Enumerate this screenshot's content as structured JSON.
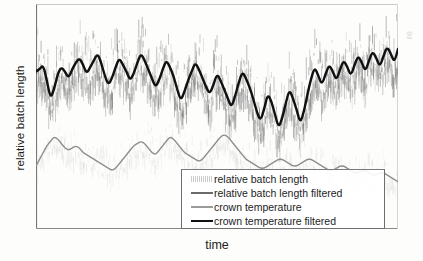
{
  "chart_data": {
    "type": "line",
    "title": "",
    "xlabel": "time",
    "ylabel": "relative batch length",
    "grid": false,
    "legend_position": "bottom-right",
    "axis_frame": "box",
    "xlim": [
      0,
      100
    ],
    "ylim": [
      0,
      100
    ],
    "x_tick_labels": [],
    "y_tick_labels": [],
    "series": [
      {
        "name": "relative batch length",
        "style": "noise",
        "color": "#6e6e6e",
        "x": [
          0,
          1,
          2,
          3,
          4,
          5,
          6,
          7,
          8,
          9,
          10,
          11,
          12,
          13,
          14,
          15,
          16,
          17,
          18,
          19,
          20,
          21,
          22,
          23,
          24,
          25,
          26,
          27,
          28,
          29,
          30,
          31,
          32,
          33,
          34,
          35,
          36,
          37,
          38,
          39,
          40,
          41,
          42,
          43,
          44,
          45,
          46,
          47,
          48,
          49,
          50,
          51,
          52,
          53,
          54,
          55,
          56,
          57,
          58,
          59,
          60,
          61,
          62,
          63,
          64,
          65,
          66,
          67,
          68,
          69,
          70,
          71,
          72,
          73,
          74,
          75,
          76,
          77,
          78,
          79,
          80,
          81,
          82,
          83,
          84,
          85,
          86,
          87,
          88,
          89,
          90,
          91,
          92,
          93,
          94,
          95,
          96,
          97,
          98,
          99,
          100
        ],
        "values": [
          72,
          66,
          78,
          58,
          80,
          62,
          75,
          55,
          83,
          60,
          70,
          52,
          79,
          64,
          86,
          58,
          74,
          61,
          81,
          54,
          77,
          66,
          85,
          57,
          73,
          63,
          82,
          56,
          76,
          68,
          88,
          59,
          71,
          53,
          80,
          65,
          84,
          60,
          75,
          50,
          78,
          62,
          87,
          55,
          72,
          64,
          83,
          58,
          76,
          51,
          69,
          60,
          81,
          54,
          74,
          47,
          68,
          57,
          79,
          49,
          71,
          43,
          65,
          52,
          77,
          45,
          62,
          40,
          70,
          48,
          66,
          38,
          58,
          44,
          72,
          50,
          78,
          55,
          83,
          60,
          79,
          57,
          85,
          63,
          80,
          58,
          86,
          64,
          82,
          59,
          87,
          66,
          83,
          61,
          88,
          67,
          84,
          62,
          89,
          70,
          86
        ],
        "noise_amplitude": 14
      },
      {
        "name": "relative batch length filtered",
        "style": "thick-line",
        "color": "#111111",
        "x": [
          0,
          1,
          2,
          3,
          4,
          5,
          6,
          7,
          8,
          9,
          10,
          11,
          12,
          13,
          14,
          15,
          16,
          17,
          18,
          19,
          20,
          21,
          22,
          23,
          24,
          25,
          26,
          27,
          28,
          29,
          30,
          31,
          32,
          33,
          34,
          35,
          36,
          37,
          38,
          39,
          40,
          41,
          42,
          43,
          44,
          45,
          46,
          47,
          48,
          49,
          50,
          51,
          52,
          53,
          54,
          55,
          56,
          57,
          58,
          59,
          60,
          61,
          62,
          63,
          64,
          65,
          66,
          67,
          68,
          69,
          70,
          71,
          72,
          73,
          74,
          75,
          76,
          77,
          78,
          79,
          80,
          81,
          82,
          83,
          84,
          85,
          86,
          87,
          88,
          89,
          90,
          91,
          92,
          93,
          94,
          95,
          96,
          97,
          98,
          99,
          100
        ],
        "values": [
          70,
          71,
          73,
          66,
          58,
          62,
          69,
          72,
          70,
          67,
          71,
          74,
          76,
          73,
          69,
          72,
          75,
          78,
          74,
          68,
          64,
          67,
          72,
          76,
          73,
          70,
          66,
          69,
          74,
          78,
          75,
          71,
          67,
          63,
          66,
          71,
          75,
          72,
          68,
          62,
          57,
          61,
          66,
          70,
          74,
          71,
          67,
          63,
          60,
          64,
          69,
          66,
          62,
          58,
          54,
          59,
          65,
          70,
          67,
          63,
          58,
          52,
          48,
          53,
          60,
          57,
          51,
          45,
          49,
          56,
          62,
          58,
          53,
          47,
          52,
          60,
          67,
          72,
          68,
          64,
          69,
          73,
          70,
          66,
          71,
          75,
          72,
          68,
          73,
          77,
          74,
          70,
          75,
          79,
          76,
          72,
          77,
          81,
          78,
          74,
          80
        ]
      },
      {
        "name": "crown temperature",
        "style": "noise-light",
        "color": "#b0b0b0",
        "x": [
          0,
          10,
          20,
          30,
          40,
          50,
          60,
          70,
          80,
          90,
          100
        ],
        "values": [
          32,
          36,
          33,
          30,
          34,
          31,
          28,
          30,
          27,
          26,
          25
        ],
        "noise_amplitude": 9
      },
      {
        "name": "crown temperature filtered",
        "style": "thin-line",
        "color": "#8e8e8e",
        "x": [
          0,
          1,
          2,
          3,
          4,
          5,
          6,
          7,
          8,
          9,
          10,
          11,
          12,
          13,
          14,
          15,
          16,
          17,
          18,
          19,
          20,
          21,
          22,
          23,
          24,
          25,
          26,
          27,
          28,
          29,
          30,
          31,
          32,
          33,
          34,
          35,
          36,
          37,
          38,
          39,
          40,
          41,
          42,
          43,
          44,
          45,
          46,
          47,
          48,
          49,
          50,
          51,
          52,
          53,
          54,
          55,
          56,
          57,
          58,
          59,
          60,
          61,
          62,
          63,
          64,
          65,
          66,
          67,
          68,
          69,
          70,
          71,
          72,
          73,
          74,
          75,
          76,
          77,
          78,
          79,
          80,
          81,
          82,
          83,
          84,
          85,
          86,
          87,
          88,
          89,
          90,
          91,
          92,
          93,
          94,
          95,
          96,
          97,
          98,
          99,
          100
        ],
        "values": [
          28,
          31,
          34,
          37,
          39,
          41,
          40,
          38,
          36,
          35,
          36,
          37,
          36,
          34,
          33,
          32,
          31,
          30,
          29,
          28,
          27,
          26,
          27,
          29,
          31,
          33,
          35,
          37,
          38,
          39,
          38,
          36,
          34,
          33,
          35,
          37,
          39,
          41,
          40,
          38,
          36,
          34,
          33,
          32,
          31,
          30,
          31,
          33,
          35,
          37,
          39,
          41,
          42,
          41,
          39,
          37,
          35,
          33,
          31,
          30,
          29,
          28,
          27,
          27,
          28,
          29,
          30,
          31,
          31,
          30,
          29,
          28,
          28,
          29,
          30,
          31,
          31,
          30,
          29,
          28,
          27,
          26,
          26,
          27,
          28,
          28,
          27,
          26,
          25,
          25,
          26,
          26,
          25,
          24,
          24,
          25,
          25,
          24,
          23,
          22,
          21
        ]
      }
    ]
  },
  "legend": {
    "entries": [
      {
        "label": "relative batch length",
        "swatch": "noise-dark-swatch"
      },
      {
        "label": "relative batch length filtered",
        "swatch": "dark-line-swatch"
      },
      {
        "label": "crown temperature",
        "swatch": "light-line-swatch"
      },
      {
        "label": "crown temperature filtered",
        "swatch": "thick-black-line-swatch"
      }
    ]
  },
  "right_edge": {
    "cropped_label": "re"
  }
}
